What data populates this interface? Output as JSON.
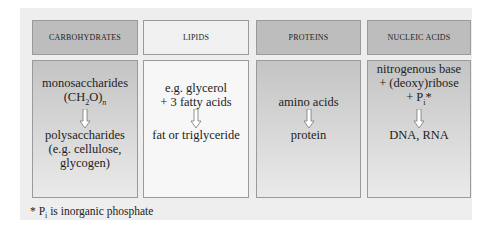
{
  "columns": [
    {
      "header": "CARBOHYDRATES",
      "top_lines": [
        "monosaccharides",
        "(CH2O)n"
      ],
      "bottom_lines": [
        "polysaccharides",
        "(e.g. cellulose,",
        "glycogen)"
      ],
      "shade": "dark"
    },
    {
      "header": "LIPIDS",
      "top_lines": [
        "e.g. glycerol",
        "+ 3 fatty acids"
      ],
      "bottom_lines": [
        "fat or triglyceride"
      ],
      "shade": "light"
    },
    {
      "header": "PROTEINS",
      "top_lines": [
        "amino acids"
      ],
      "bottom_lines": [
        "protein"
      ],
      "shade": "dark"
    },
    {
      "header": "NUCLEIC ACIDS",
      "top_lines": [
        "nitrogenous base",
        "+ (deoxy)ribose",
        "+ Pi*"
      ],
      "bottom_lines": [
        "DNA, RNA"
      ],
      "shade": "dark"
    }
  ],
  "footnote": "* Pi is inorganic phosphate",
  "icons": {
    "arrow": "down-arrow-icon"
  },
  "colors": {
    "panel": "#eeeeee",
    "dark_header": "#bdbdbd",
    "light_header": "#f0f0f0",
    "border": "#9a9a9a"
  }
}
